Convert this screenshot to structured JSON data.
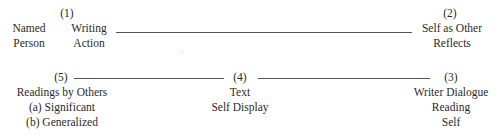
{
  "nodes": {
    "n1": {
      "number": "(1)",
      "left_label": [
        "Named",
        "Person"
      ],
      "right_label": [
        "Writing",
        "Action"
      ]
    },
    "n2": {
      "number": "(2)",
      "label": [
        "Self as Other",
        "Reflects"
      ]
    },
    "n3": {
      "number": "(3)",
      "label": [
        "Writer Dialogue",
        "Reading",
        "Self"
      ]
    },
    "n4": {
      "number": "(4)",
      "label": [
        "Text",
        "Self Display"
      ]
    },
    "n5": {
      "number": "(5)",
      "label": [
        "Readings by Others",
        "(a) Significant",
        "(b) Generalized"
      ]
    }
  },
  "connections": [
    {
      "from": "n1",
      "to": "n2"
    },
    {
      "from": "n5",
      "to": "n4"
    },
    {
      "from": "n4",
      "to": "n3"
    }
  ]
}
